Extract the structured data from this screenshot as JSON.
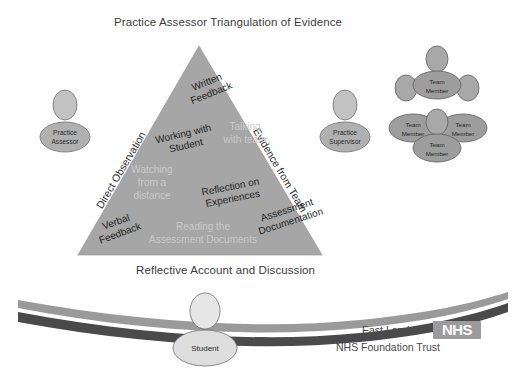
{
  "diagram": {
    "title": "Practice Assessor Triangulation of Evidence",
    "bottom_caption": "Reflective Account and Discussion",
    "triangle": {
      "edge_labels": [
        {
          "id": "left-edge",
          "text": "Direct Observation"
        },
        {
          "id": "right-edge",
          "text": "Evidence from Team"
        }
      ],
      "primary_labels": [
        {
          "id": "written-feedback",
          "line1": "Written",
          "line2": "Feedback"
        },
        {
          "id": "working-with-student",
          "line1": "Working with",
          "line2": "Student"
        },
        {
          "id": "verbal-feedback",
          "line1": "Verbal",
          "line2": "Feedback"
        },
        {
          "id": "reflection-on-experiences",
          "line1": "Reflection on",
          "line2": "Experiences"
        },
        {
          "id": "assessment-documentation",
          "line1": "Assessment",
          "line2": "Documentation"
        }
      ],
      "secondary_labels": [
        {
          "id": "talking-with-team",
          "line1": "Talking",
          "line2": "with team"
        },
        {
          "id": "watching-from-a-distance",
          "line1": "Watching",
          "line2": "from a",
          "line3": "distance"
        },
        {
          "id": "reading-the-assessment-documents",
          "line1": "Reading the",
          "line2": "Assessment Documents"
        }
      ]
    },
    "figures": {
      "practice_assessor": {
        "line1": "Practice",
        "line2": "Assessor"
      },
      "practice_supervisor": {
        "line1": "Practice",
        "line2": "Supervisor"
      },
      "student": {
        "label": "Student"
      },
      "team_members": [
        {
          "line1": "Team",
          "line2": "Member"
        },
        {
          "line1": "Team",
          "line2": "Member"
        },
        {
          "line1": "Team",
          "line2": "Member"
        },
        {
          "line1": "Team",
          "line2": "Member"
        }
      ]
    },
    "logo": {
      "org_line1": "East London",
      "org_line2": "NHS Foundation Trust",
      "badge_text": "NHS"
    },
    "colors": {
      "triangle_fill": "#a6a6a6",
      "triangle_stroke": "#8f8f8f",
      "dark_text": "#1f1f1f",
      "light_text": "#c9c9c9",
      "wave_top": "#9a9a9a",
      "wave_bottom": "#4a4a4a",
      "nhs_badge": "#9b9b9b",
      "person_body": "#b0b0b0",
      "team_body": "#9d9d9d",
      "student_body": "#dedede"
    }
  }
}
